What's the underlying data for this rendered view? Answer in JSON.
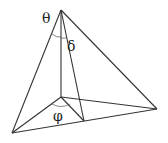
{
  "diagram": {
    "type": "pyramid-angles",
    "vertices": {
      "apex": [
        61,
        10
      ],
      "foot": [
        61,
        97
      ],
      "left": [
        12,
        133
      ],
      "right": [
        157,
        109
      ],
      "mid": [
        84,
        121
      ]
    },
    "labels": {
      "theta": "θ",
      "delta": "δ",
      "phi": "φ"
    },
    "colors": {
      "line": "#333333",
      "background": "#ffffff"
    }
  }
}
